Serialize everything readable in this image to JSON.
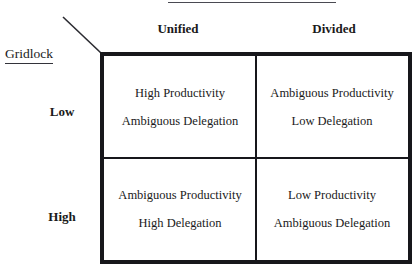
{
  "figure": {
    "top_header": {
      "label": "Government",
      "clipped": true
    },
    "row_axis_label": "Gridlock",
    "column_headers": [
      "Unified",
      "Divided"
    ],
    "row_headers": [
      "Low",
      "High"
    ],
    "cells": [
      {
        "line1": "High Productivity",
        "line2": "Ambiguous Delegation"
      },
      {
        "line1": "Ambiguous Productivity",
        "line2": "Low Delegation"
      },
      {
        "line1": "Ambiguous Productivity",
        "line2": "High Delegation"
      },
      {
        "line1": "Low Productivity",
        "line2": "Ambiguous Delegation"
      }
    ],
    "colors": {
      "border": "#17171b",
      "text": "#1a1a1a",
      "rule": "#4a4a52",
      "background": "#ffffff"
    }
  }
}
